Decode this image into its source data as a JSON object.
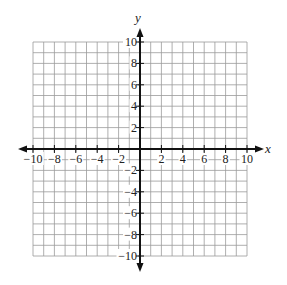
{
  "chart_data": {
    "type": "coordinate-grid",
    "title": "",
    "xlabel": "x",
    "ylabel": "y",
    "xlim": [
      -10,
      10
    ],
    "ylim": [
      -10,
      10
    ],
    "grid": true,
    "grid_step": 1,
    "x_tick_labels": [
      "-10",
      "-8",
      "-6",
      "-4",
      "-2",
      "2",
      "4",
      "6",
      "8",
      "10"
    ],
    "y_tick_labels": [
      "10",
      "8",
      "6",
      "4",
      "2",
      "-2",
      "-4",
      "-6",
      "-8",
      "-10"
    ],
    "x_tick_values": [
      -10,
      -8,
      -6,
      -4,
      -2,
      2,
      4,
      6,
      8,
      10
    ],
    "y_tick_values": [
      10,
      8,
      6,
      4,
      2,
      -2,
      -4,
      -6,
      -8,
      -10
    ],
    "series": []
  },
  "axes": {
    "x_label": "x",
    "y_label": "y"
  },
  "colors": {
    "grid": "#9a9a9a",
    "axis": "#111111",
    "text": "#222222",
    "background": "#ffffff"
  }
}
